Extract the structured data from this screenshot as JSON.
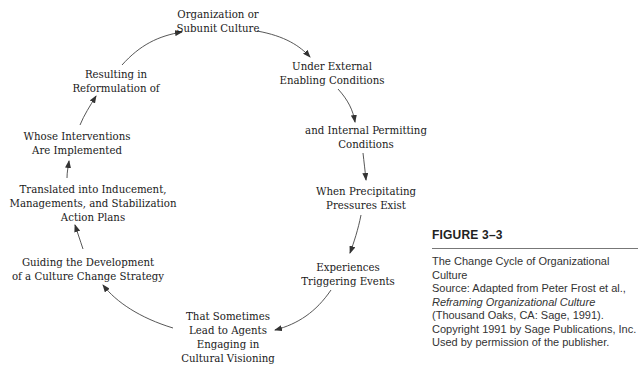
{
  "diagram": {
    "type": "cycle",
    "direction": "clockwise",
    "nodes": [
      {
        "id": "n1",
        "label": "Organization or\nSubunit Culture"
      },
      {
        "id": "n2",
        "label": "Under External\nEnabling Conditions"
      },
      {
        "id": "n3",
        "label": "and Internal Permitting\nConditions"
      },
      {
        "id": "n4",
        "label": "When Precipitating\nPressures Exist"
      },
      {
        "id": "n5",
        "label": "Experiences\nTriggering Events"
      },
      {
        "id": "n6",
        "label": "That Sometimes\nLead to Agents\nEngaging in\nCultural Visioning"
      },
      {
        "id": "n7",
        "label": "Guiding the Development\nof a Culture Change Strategy"
      },
      {
        "id": "n8",
        "label": "Translated into Inducement,\nManagements, and Stabilization\nAction Plans"
      },
      {
        "id": "n9",
        "label": "Whose Interventions\nAre Implemented"
      },
      {
        "id": "n10",
        "label": "Resulting in\nReformulation of"
      }
    ],
    "edges": [
      {
        "from": "n1",
        "to": "n2"
      },
      {
        "from": "n2",
        "to": "n3"
      },
      {
        "from": "n3",
        "to": "n4"
      },
      {
        "from": "n4",
        "to": "n5"
      },
      {
        "from": "n5",
        "to": "n6"
      },
      {
        "from": "n6",
        "to": "n7"
      },
      {
        "from": "n7",
        "to": "n8"
      },
      {
        "from": "n8",
        "to": "n9"
      },
      {
        "from": "n9",
        "to": "n10"
      },
      {
        "from": "n10",
        "to": "n1"
      }
    ]
  },
  "caption": {
    "figure_label": "FIGURE 3–3",
    "title": "The Change Cycle of Organizational Culture",
    "source_prefix": "Source: Adapted from Peter Frost et al.,",
    "source_book": "Reframing Organizational Culture",
    "source_suffix": "(Thousand Oaks, CA: Sage, 1991). Copyright 1991 by Sage Publications, Inc. Used by permission of the publisher."
  },
  "colors": {
    "text": "#1a1a1a",
    "arrow": "#333333",
    "rule": "#777777"
  }
}
